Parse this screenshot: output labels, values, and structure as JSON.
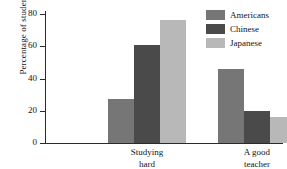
{
  "chart_data": {
    "type": "bar",
    "title": "",
    "xlabel": "",
    "ylabel": "Percentage of students",
    "categories": [
      "Studying\nhard",
      "A good\nteacher"
    ],
    "series": [
      {
        "name": "Americans",
        "values": [
          27,
          46
        ],
        "color": "#767676"
      },
      {
        "name": "Chinese",
        "values": [
          61,
          20
        ],
        "color": "#4a4a4a"
      },
      {
        "name": "Japanese",
        "values": [
          76,
          16
        ],
        "color": "#b8b8b8"
      }
    ],
    "ylim": [
      0,
      80
    ],
    "yticks": [
      0,
      20,
      40,
      60,
      80
    ],
    "ytick_labels": [
      "0",
      "20",
      "40",
      "60",
      "80"
    ],
    "grid": false,
    "legend_position": "top-right",
    "axis_color": "#2b2b2b",
    "background": "#ffffff"
  }
}
